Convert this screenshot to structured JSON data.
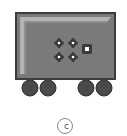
{
  "figure": {
    "colors": {
      "outline": "#3c3c3c",
      "body": "#7a7a7a",
      "highlight": "#bdbdbd",
      "wheel": "#4a4a4a",
      "marker_dark": "#3a3a3a",
      "marker_light": "#ffffff"
    },
    "markers": {
      "flower_count": 4,
      "square_count": 1
    },
    "wheel_count": 4
  },
  "option": {
    "label": "c"
  }
}
